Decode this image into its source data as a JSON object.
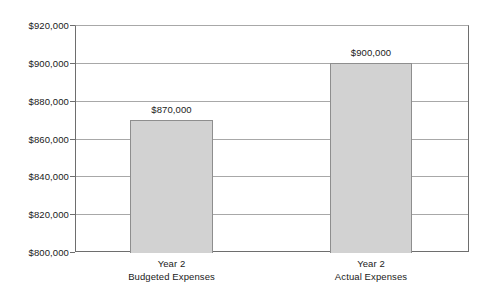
{
  "chart_data": {
    "type": "bar",
    "title": "",
    "subtitle": "",
    "xlabel": "",
    "ylabel": "",
    "categories": [
      "Year 2 Budgeted Expenses",
      "Year 2 Actual Expenses"
    ],
    "category_lines": [
      [
        "Year 2",
        "Budgeted Expenses"
      ],
      [
        "Year 2",
        "Actual Expenses"
      ]
    ],
    "values": [
      870000,
      900000
    ],
    "value_labels": [
      "$870,000",
      "$900,000"
    ],
    "ylim": [
      800000,
      920000
    ],
    "ytick_values": [
      800000,
      820000,
      840000,
      860000,
      880000,
      900000,
      920000
    ],
    "ytick_labels": [
      "$800,000",
      "$820,000",
      "$840,000",
      "$860,000",
      "$880,000",
      "$900,000",
      "$920,000"
    ],
    "grid": true,
    "legend": false,
    "legend_position": "none",
    "bar_fill_color": "#d2d2d2",
    "bar_border_color": "#8e8e8e",
    "gridline_color": "#a8a8a8",
    "axis_color": "#6e6e6e",
    "text_color": "#1a1a1a",
    "background_color": "#ffffff"
  },
  "layout": {
    "plot_left": 75,
    "plot_top": 25,
    "plot_width": 394,
    "plot_height": 227,
    "bars": [
      {
        "center_x": 171.5,
        "left": 130,
        "width": 83
      },
      {
        "center_x": 371.0,
        "left": 330,
        "width": 82
      }
    ]
  }
}
